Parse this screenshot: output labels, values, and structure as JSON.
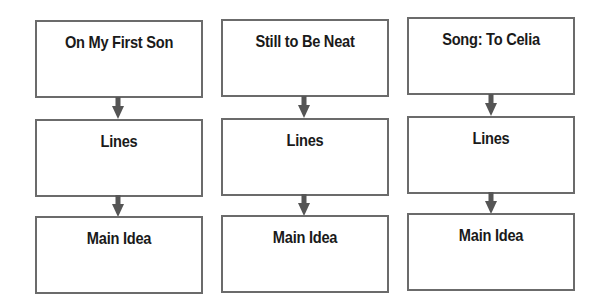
{
  "diagram": {
    "type": "three-column flow chart",
    "colors": {
      "box_border": "#6b6b6b",
      "arrow": "#555555",
      "text": "#1a1a1a",
      "background": "#ffffff"
    },
    "columns": [
      {
        "title": "On My First Son",
        "lines_label": "Lines",
        "main_idea_label": "Main Idea"
      },
      {
        "title": "Still to Be Neat",
        "lines_label": "Lines",
        "main_idea_label": "Main Idea"
      },
      {
        "title": "Song: To Celia",
        "lines_label": "Lines",
        "main_idea_label": "Main Idea"
      }
    ]
  }
}
